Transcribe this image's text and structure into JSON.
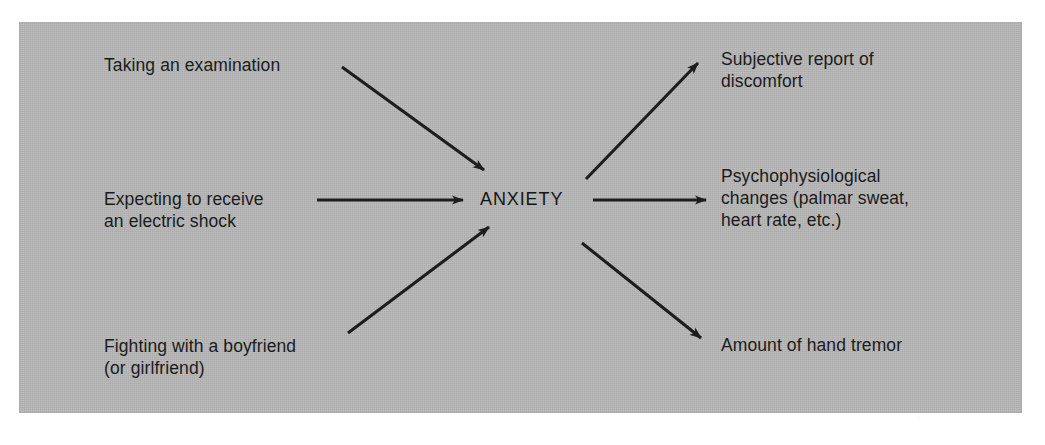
{
  "figure": {
    "center_node": {
      "label": "ANXIETY",
      "name": "construct"
    },
    "antecedents": [
      {
        "id": "exam",
        "label": "Taking an examination",
        "arrow": "arrow-exam-to-anxiety"
      },
      {
        "id": "shock",
        "label": "Expecting to receive\nan electric shock",
        "arrow": "arrow-shock-to-anxiety"
      },
      {
        "id": "fight",
        "label": "Fighting with a boyfriend\n(or girlfriend)",
        "arrow": "arrow-fight-to-anxiety"
      }
    ],
    "indicators": [
      {
        "id": "subjective",
        "label": "Subjective report of\ndiscomfort",
        "arrow": "arrow-anxiety-to-subjective"
      },
      {
        "id": "physio",
        "label": "Psychophysiological\nchanges (palmar sweat,\nheart rate, etc.)",
        "arrow": "arrow-anxiety-to-physio"
      },
      {
        "id": "tremor",
        "label": "Amount of hand tremor",
        "arrow": "arrow-anxiety-to-tremor"
      }
    ],
    "colors": {
      "panel_background": "#b3b3b3",
      "page_background": "#ffffff",
      "ink": "#1b1b1b",
      "arrow": "#1d1d1d"
    }
  }
}
